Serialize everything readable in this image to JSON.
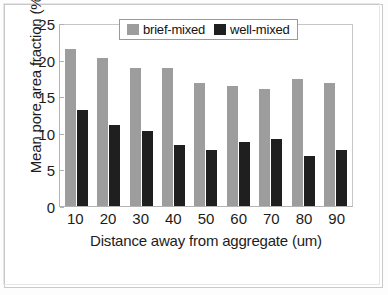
{
  "chart_data": {
    "type": "bar",
    "title": "",
    "subtitle": "",
    "xlabel": "Distance away from aggregate (um)",
    "ylabel": "Mean pore area fraction (%)",
    "categories": [
      "10",
      "20",
      "30",
      "40",
      "50",
      "60",
      "70",
      "80",
      "90"
    ],
    "series": [
      {
        "name": "brief-mixed",
        "color": "#9d9d9d",
        "values": [
          21.4,
          20.2,
          18.9,
          18.8,
          16.8,
          16.4,
          16.0,
          17.4,
          16.8
        ]
      },
      {
        "name": "well-mixed",
        "color": "#1f1f1f",
        "values": [
          13.1,
          11.0,
          10.3,
          8.3,
          7.6,
          8.8,
          9.2,
          6.9,
          7.7
        ]
      }
    ],
    "ylim": [
      0,
      25
    ],
    "ytick_values": [
      0,
      5,
      10,
      15,
      20,
      25
    ],
    "ytick_labels": [
      "0",
      "5",
      "10",
      "15",
      "20",
      "25"
    ],
    "xtick_labels": [
      "10",
      "20",
      "30",
      "40",
      "50",
      "60",
      "70",
      "80",
      "90"
    ],
    "grid": false,
    "legend_position": "top-center",
    "legend_entries": [
      "brief-mixed",
      "well-mixed"
    ]
  },
  "legend": {
    "items": [
      {
        "label": "brief-mixed"
      },
      {
        "label": "well-mixed"
      }
    ]
  }
}
